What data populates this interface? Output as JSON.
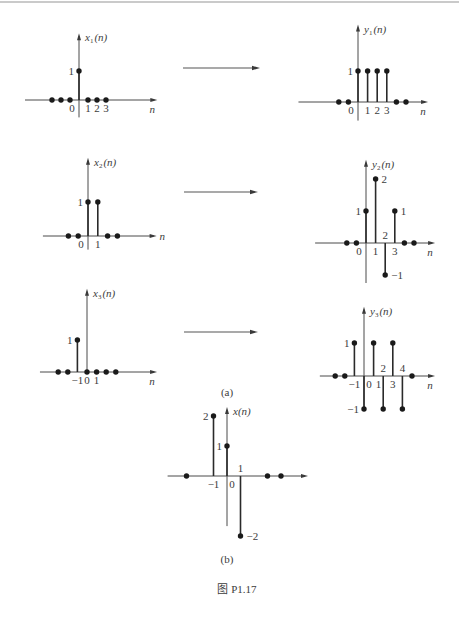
{
  "figure": {
    "caption_a": "(a)",
    "caption_b": "(b)",
    "figure_label": "图 P1.17"
  },
  "mappings": [
    {
      "from": "x1",
      "to": "y1"
    },
    {
      "from": "x2",
      "to": "y2"
    },
    {
      "from": "x3",
      "to": "y3"
    }
  ],
  "chart_data": [
    {
      "id": "x1",
      "type": "bar",
      "style": "stem",
      "panel": "(a)",
      "title": {
        "var": "x",
        "sub": "1",
        "arg": "(n)"
      },
      "xlabel": "n",
      "xlabel_position": "below-end",
      "x": [
        -3,
        -2,
        -1,
        0,
        1,
        2,
        3
      ],
      "values": [
        0,
        0,
        0,
        1,
        0,
        0,
        0
      ],
      "xlim": [
        -6,
        8.7
      ],
      "ylim": [
        -0.6,
        2.3
      ],
      "grid": false,
      "tick_labels": [
        {
          "text": "0",
          "n": 0,
          "side": "below-left"
        },
        {
          "text": "1",
          "n": 1,
          "side": "below"
        },
        {
          "text": "2",
          "n": 2,
          "side": "below"
        },
        {
          "text": "3",
          "n": 3,
          "side": "below"
        }
      ],
      "value_labels": [
        {
          "text": "1",
          "n": 0,
          "value": 1,
          "side": "left"
        }
      ]
    },
    {
      "id": "y1",
      "type": "bar",
      "style": "stem",
      "panel": "(a)",
      "title": {
        "var": "y",
        "sub": "1",
        "arg": "(n)"
      },
      "xlabel": "n",
      "xlabel_position": "below-end",
      "x": [
        -2,
        -1,
        0,
        1,
        2,
        3,
        4,
        5
      ],
      "values": [
        0,
        0,
        1,
        1,
        1,
        1,
        0,
        0
      ],
      "xlim": [
        -6.2,
        7.3
      ],
      "ylim": [
        -0.6,
        2.5
      ],
      "grid": false,
      "tick_labels": [
        {
          "text": "0",
          "n": 0,
          "side": "below-left"
        },
        {
          "text": "1",
          "n": 1,
          "side": "below"
        },
        {
          "text": "2",
          "n": 2,
          "side": "below"
        },
        {
          "text": "3",
          "n": 3,
          "side": "below"
        }
      ],
      "value_labels": [
        {
          "text": "1",
          "n": 0,
          "value": 1,
          "side": "left"
        }
      ]
    },
    {
      "id": "x2",
      "type": "bar",
      "style": "stem",
      "panel": "(a)",
      "title": {
        "var": "x",
        "sub": "2",
        "arg": "(n)"
      },
      "xlabel": "n",
      "xlabel_position": "end-right",
      "x": [
        -2,
        -1,
        0,
        1,
        2,
        3
      ],
      "values": [
        0,
        0,
        1,
        1,
        0,
        0
      ],
      "xlim": [
        -4.6,
        7.0
      ],
      "ylim": [
        -0.4,
        2.3
      ],
      "grid": false,
      "tick_labels": [
        {
          "text": "0",
          "n": 0,
          "side": "below-left"
        },
        {
          "text": "1",
          "n": 1,
          "side": "below"
        }
      ],
      "value_labels": [
        {
          "text": "1",
          "n": 0,
          "value": 1,
          "side": "left"
        }
      ]
    },
    {
      "id": "y2",
      "type": "bar",
      "style": "stem",
      "panel": "(a)",
      "title": {
        "var": "y",
        "sub": "2",
        "arg": "(n)"
      },
      "xlabel": "n",
      "xlabel_position": "below-end",
      "x": [
        -2,
        -1,
        0,
        1,
        2,
        3,
        4,
        5
      ],
      "values": [
        0,
        0,
        1,
        2,
        -1,
        1,
        0,
        0
      ],
      "xlim": [
        -5.3,
        7.2
      ],
      "ylim": [
        -1.25,
        2.6
      ],
      "grid": false,
      "tick_labels": [
        {
          "text": "0",
          "n": 0,
          "side": "below-left"
        },
        {
          "text": "1",
          "n": 1,
          "side": "below"
        },
        {
          "text": "2",
          "n": 2,
          "side": "above"
        },
        {
          "text": "3",
          "n": 3,
          "side": "below"
        }
      ],
      "value_labels": [
        {
          "text": "1",
          "n": 0,
          "value": 1,
          "side": "left"
        },
        {
          "text": "2",
          "n": 1,
          "value": 2,
          "side": "right"
        },
        {
          "text": "1",
          "n": 3,
          "value": 1,
          "side": "right"
        },
        {
          "text": "−1",
          "n": 2,
          "value": -1,
          "side": "right"
        }
      ]
    },
    {
      "id": "x3",
      "type": "bar",
      "style": "stem",
      "panel": "(a)",
      "title": {
        "var": "x",
        "sub": "3",
        "arg": "(n)"
      },
      "xlabel": "n",
      "xlabel_position": "below-end",
      "x": [
        -3,
        -2,
        -1,
        0,
        1,
        2,
        3
      ],
      "values": [
        0,
        0,
        1,
        0,
        0,
        0,
        0
      ],
      "xlim": [
        -4.9,
        7.3
      ],
      "ylim": [
        0,
        2.6
      ],
      "grid": false,
      "tick_labels": [
        {
          "text": "−1",
          "n": -1,
          "side": "below"
        },
        {
          "text": "0",
          "n": 0,
          "side": "below"
        },
        {
          "text": "1",
          "n": 1,
          "side": "below"
        }
      ],
      "value_labels": [
        {
          "text": "1",
          "n": -1,
          "value": 1,
          "side": "left"
        }
      ]
    },
    {
      "id": "y3",
      "type": "bar",
      "style": "stem",
      "panel": "(a)",
      "title": {
        "var": "y",
        "sub": "3",
        "arg": "(n)"
      },
      "xlabel": "n",
      "xlabel_position": "below-end",
      "x": [
        -3,
        -2,
        -1,
        0,
        1,
        2,
        3,
        4,
        5
      ],
      "values": [
        0,
        0,
        1,
        -1,
        1,
        -1,
        1,
        -1,
        0
      ],
      "xlim": [
        -4.6,
        7.4
      ],
      "ylim": [
        -1,
        2.1
      ],
      "grid": false,
      "tick_labels": [
        {
          "text": "−1",
          "n": -1,
          "side": "below"
        },
        {
          "text": "0",
          "n": 0,
          "side": "below-right"
        },
        {
          "text": "1",
          "n": 1,
          "side": "below-right"
        },
        {
          "text": "2",
          "n": 2,
          "side": "above"
        },
        {
          "text": "3",
          "n": 3,
          "side": "below"
        },
        {
          "text": "4",
          "n": 4,
          "side": "above"
        }
      ],
      "value_labels": [
        {
          "text": "1",
          "n": -1,
          "value": 1,
          "side": "left"
        },
        {
          "text": "−1",
          "n": 0,
          "value": -1,
          "side": "left"
        }
      ]
    },
    {
      "id": "x",
      "type": "bar",
      "style": "stem",
      "panel": "(b)",
      "title": {
        "var": "x",
        "sub": "",
        "arg": "(n)"
      },
      "xlabel": "",
      "xlabel_position": "none",
      "x": [
        -3,
        -1,
        0,
        1,
        3,
        4
      ],
      "values": [
        0,
        2,
        1,
        -2,
        0,
        0
      ],
      "xlim": [
        -4.4,
        6.0
      ],
      "ylim": [
        -1.67,
        2.3
      ],
      "grid": false,
      "tick_labels": [
        {
          "text": "−1",
          "n": -1,
          "side": "below"
        },
        {
          "text": "0",
          "n": 0,
          "side": "below-right"
        },
        {
          "text": "1",
          "n": 1,
          "side": "above"
        }
      ],
      "value_labels": [
        {
          "text": "2",
          "n": -1,
          "value": 2,
          "side": "left"
        },
        {
          "text": "1",
          "n": 0,
          "value": 1,
          "side": "left"
        },
        {
          "text": "−2",
          "n": 1,
          "value": -2,
          "side": "right"
        }
      ]
    }
  ]
}
